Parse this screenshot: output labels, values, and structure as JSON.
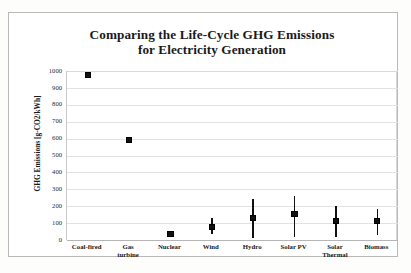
{
  "chart_data": {
    "type": "scatter",
    "title": "Comparing the Life-Cycle GHG Emissions for Electricity Generation",
    "title_line1": "Comparing the Life-Cycle GHG Emissions",
    "title_line2": "for Electricity Generation",
    "xlabel": "",
    "ylabel": "GHG Emissions [g-CO2/kWh]",
    "ylim": [
      0,
      1000
    ],
    "yticks": [
      1000,
      900,
      800,
      700,
      600,
      500,
      400,
      300,
      200,
      100,
      0
    ],
    "ytick_labels": [
      "1000",
      "900",
      "800",
      "700",
      "600",
      "500",
      "400",
      "300",
      "200",
      "100",
      "0"
    ],
    "grid": true,
    "legend": false,
    "marker_color": "#111111",
    "categories": [
      "Coal-fired",
      "Gas turbine",
      "Nuclear",
      "Wind",
      "Hydro",
      "Solar PV",
      "Solar Thermal",
      "Biomass"
    ],
    "category_lines": [
      [
        "Coal-fired"
      ],
      [
        "Gas",
        "turbine"
      ],
      [
        "Nuclear"
      ],
      [
        "Wind"
      ],
      [
        "Hydro"
      ],
      [
        "Solar PV"
      ],
      [
        "Solar",
        "Thermal"
      ],
      [
        "Biomass"
      ]
    ],
    "values": [
      975,
      592,
      35,
      78,
      130,
      154,
      112,
      112
    ],
    "error_low": [
      975,
      592,
      35,
      38,
      12,
      18,
      18,
      30
    ],
    "error_high": [
      975,
      592,
      35,
      130,
      242,
      260,
      200,
      183
    ],
    "points": [
      {
        "category": "Coal-fired",
        "value": 975,
        "low": 975,
        "high": 975
      },
      {
        "category": "Gas turbine",
        "value": 592,
        "low": 592,
        "high": 592
      },
      {
        "category": "Nuclear",
        "value": 35,
        "low": 35,
        "high": 35
      },
      {
        "category": "Wind",
        "value": 78,
        "low": 38,
        "high": 130
      },
      {
        "category": "Hydro",
        "value": 130,
        "low": 12,
        "high": 242
      },
      {
        "category": "Solar PV",
        "value": 154,
        "low": 18,
        "high": 260
      },
      {
        "category": "Solar Thermal",
        "value": 112,
        "low": 18,
        "high": 200
      },
      {
        "category": "Biomass",
        "value": 112,
        "low": 30,
        "high": 183
      }
    ]
  }
}
